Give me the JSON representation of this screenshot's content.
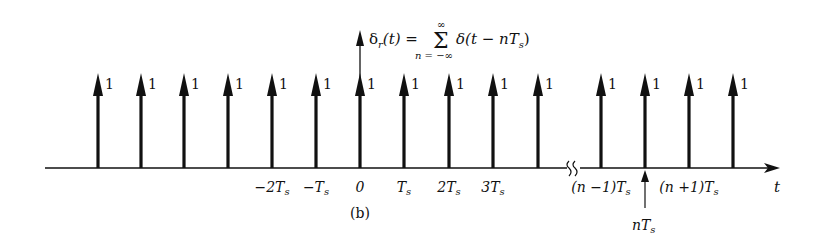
{
  "diagram": {
    "title_expr": {
      "lhs": "δ",
      "lhs_sub": "r",
      "lhs_arg": "(t) =",
      "sum": "Σ",
      "sum_upper": "∞",
      "sum_lower": "n = −∞",
      "rhs": "δ(t − nT",
      "rhs_sub": "s",
      "rhs_close": ")"
    },
    "impulse_weight": "1",
    "left_impulses_x": [
      98,
      141,
      184,
      228,
      272,
      316,
      360,
      404,
      449,
      493,
      538
    ],
    "right_impulses_x": [
      601,
      645,
      689,
      733
    ],
    "tick_labels": [
      {
        "text": "−2T",
        "sub": "s",
        "x": 272
      },
      {
        "text": "−T",
        "sub": "s",
        "x": 316
      },
      {
        "text": "0",
        "sub": "",
        "x": 360
      },
      {
        "text": "T",
        "sub": "s",
        "x": 404
      },
      {
        "text": "2T",
        "sub": "s",
        "x": 449
      },
      {
        "text": "3T",
        "sub": "s",
        "x": 493
      },
      {
        "text": "(n −1)T",
        "sub": "s",
        "x": 601
      },
      {
        "text": "(n +1)T",
        "sub": "s",
        "x": 689
      }
    ],
    "nTs_label": {
      "text": "nT",
      "sub": "s"
    },
    "axis_label": "t",
    "caption": "(b)"
  }
}
